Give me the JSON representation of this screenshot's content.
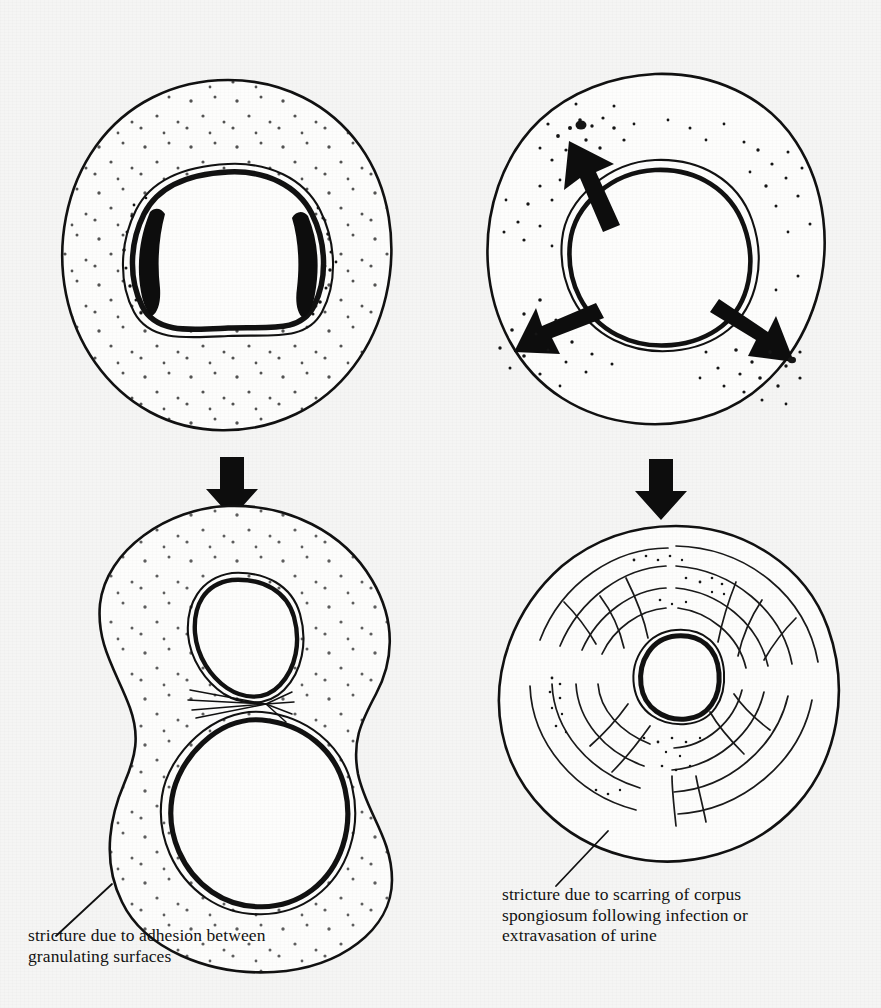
{
  "figure": {
    "kind": "medical-line-illustration",
    "background_color": "#f5f5f4",
    "ink_color": "#111111",
    "panels": [
      {
        "id": "top-left",
        "name": "urethra-with-granulating-surfaces",
        "description": "cross-section: outer corpus spongiosum outline with light stippling, inner urethral lumen ring with heavy black granulating patches on the left and right lateral walls",
        "center": [
          228,
          248
        ],
        "outer_radius": 168,
        "lumen_radius": 78
      },
      {
        "id": "top-right",
        "name": "urethra-with-extravasation",
        "description": "cross-section: outer corpus spongiosum outline, inner urethral lumen ring with three arrows radiating outward into dense stippled clusters of extravasated urine",
        "center": [
          655,
          245
        ],
        "outer_radius": 170,
        "lumen_radius": 80,
        "arrow_count": 3,
        "arrow_directions_deg": [
          -62,
          205,
          330
        ]
      },
      {
        "id": "bottom-left",
        "name": "figure-of-eight-adhesion-outcome",
        "description": "peanut / figure-of-eight cross-section with two separate lumens joined at the waist by fine adhesion strands",
        "lumens": 2,
        "adhesion_strands": 7
      },
      {
        "id": "bottom-right",
        "name": "concentric-scarring-outcome",
        "description": "cross-section with concentric swirling scar fibres throughout the corpus spongiosum surrounding a small constricted central lumen",
        "center": [
          676,
          676
        ],
        "outer_radius": 152,
        "lumen_radius": 44
      }
    ],
    "flow_arrows": [
      {
        "name": "down-arrow-left",
        "x": 232,
        "y": 487,
        "direction": "down"
      },
      {
        "name": "down-arrow-right",
        "x": 661,
        "y": 489,
        "direction": "down"
      }
    ],
    "leader_lines": [
      {
        "name": "leader-line-left",
        "from": [
          56,
          936
        ],
        "to": [
          112,
          884
        ]
      },
      {
        "name": "leader-line-right",
        "from": [
          556,
          886
        ],
        "to": [
          608,
          831
        ]
      }
    ]
  },
  "captions": {
    "left": "stricture due to adhesion between\ngranulating surfaces",
    "right": "stricture due to scarring of corpus\nspongiosum following infection or\nextravasation of urine"
  }
}
